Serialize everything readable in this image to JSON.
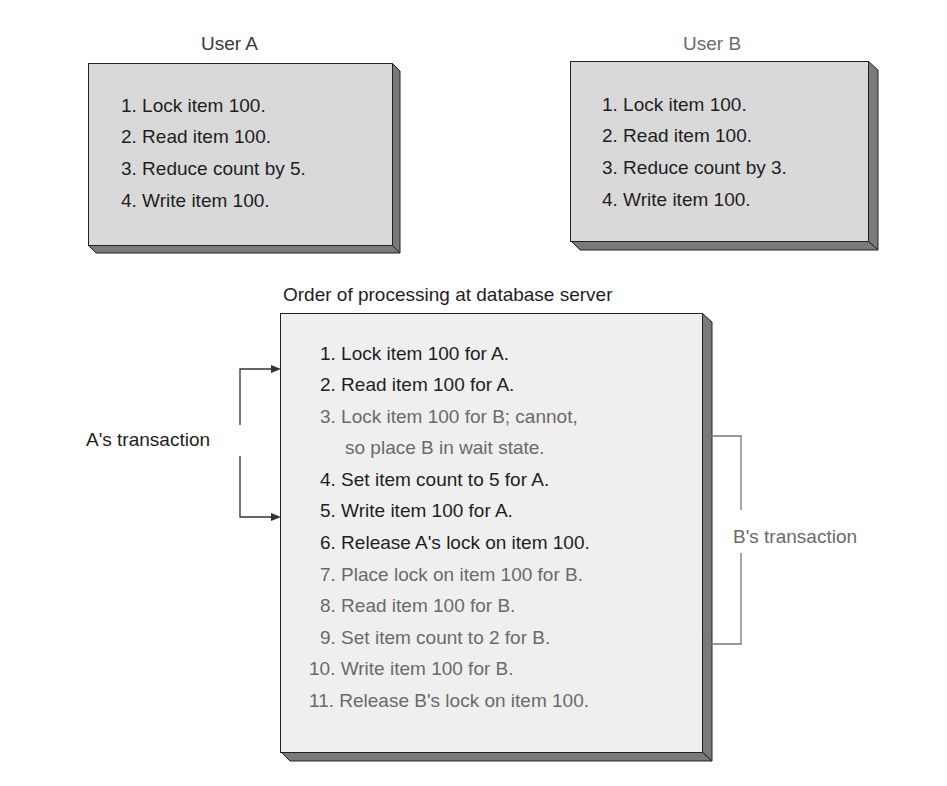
{
  "user_a": {
    "title": "User A",
    "steps": [
      "1. Lock item 100.",
      "2. Read item 100.",
      "3. Reduce count by 5.",
      "4. Write item 100."
    ]
  },
  "user_b": {
    "title": "User B",
    "steps": [
      "1. Lock item 100.",
      "2. Read item 100.",
      "3. Reduce count by 3.",
      "4. Write item 100."
    ]
  },
  "server": {
    "title": "Order of processing at database server",
    "steps": [
      {
        "text": "1. Lock item 100 for A.",
        "owner": "A"
      },
      {
        "text": "2. Read item 100 for A.",
        "owner": "A"
      },
      {
        "text": "3. Lock item 100 for B; cannot,",
        "owner": "B"
      },
      {
        "text": "so place B in wait state.",
        "owner": "B"
      },
      {
        "text": "4. Set item count to 5 for A.",
        "owner": "A"
      },
      {
        "text": "5. Write item 100 for A.",
        "owner": "A"
      },
      {
        "text": "6. Release A's lock on item 100.",
        "owner": "A"
      },
      {
        "text": "7. Place lock on item 100 for B.",
        "owner": "B"
      },
      {
        "text": "8. Read item 100 for B.",
        "owner": "B"
      },
      {
        "text": "9. Set item count to 2 for B.",
        "owner": "B"
      },
      {
        "text": "10. Write item 100 for B.",
        "owner": "B"
      },
      {
        "text": "11. Release B's lock on item 100.",
        "owner": "B"
      }
    ]
  },
  "labels": {
    "a_transaction": "A's transaction",
    "b_transaction": "B's transaction"
  },
  "colors": {
    "box_fill": "#d9d9d9",
    "server_fill": "#efefef",
    "bevel": "#7a7a7a",
    "a_text": "#1e1e1e",
    "b_text": "#6a6a6a"
  }
}
